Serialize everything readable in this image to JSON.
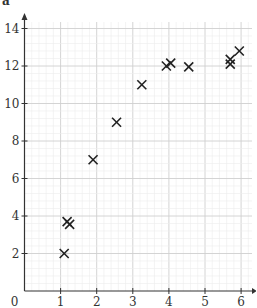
{
  "chart_data": {
    "type": "scatter",
    "title": "",
    "panel_label": "a",
    "xlabel": "",
    "ylabel": "",
    "xlim": [
      0,
      6.3
    ],
    "ylim": [
      0,
      15
    ],
    "x_ticks": [
      1,
      2,
      3,
      4,
      5,
      6
    ],
    "y_ticks": [
      2,
      4,
      6,
      8,
      10,
      12,
      14
    ],
    "origin_label": "0",
    "grid": true,
    "marker": "x",
    "marker_color": "#222222",
    "series": [
      {
        "name": "data",
        "points": [
          {
            "x": 1.1,
            "y": 2.0
          },
          {
            "x": 1.18,
            "y": 3.7
          },
          {
            "x": 1.25,
            "y": 3.55
          },
          {
            "x": 1.9,
            "y": 7.0
          },
          {
            "x": 2.55,
            "y": 9.0
          },
          {
            "x": 3.25,
            "y": 11.0
          },
          {
            "x": 3.93,
            "y": 12.0
          },
          {
            "x": 4.05,
            "y": 12.15
          },
          {
            "x": 4.55,
            "y": 11.95
          },
          {
            "x": 5.7,
            "y": 12.1
          },
          {
            "x": 5.7,
            "y": 12.35
          },
          {
            "x": 5.95,
            "y": 12.8
          }
        ]
      }
    ]
  }
}
